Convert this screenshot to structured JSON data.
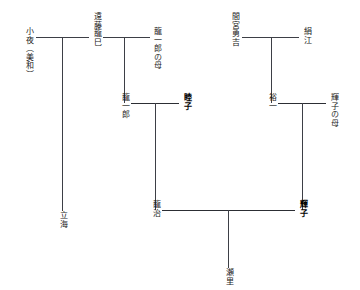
{
  "diagram": {
    "type": "genealogy-chart",
    "orientation": "vertical-japanese-text",
    "line_color": "#3d3f46",
    "background": "#ffffff",
    "persons": [
      {
        "id": "sayo",
        "label": "小夜（美和）",
        "generation": 1,
        "emphasis": false
      },
      {
        "id": "endo-tatsumi",
        "label": "遠藤龍巳",
        "generation": 1,
        "emphasis": false
      },
      {
        "id": "ryuichiro-haha",
        "label": "龍一郎の母",
        "generation": 1,
        "emphasis": false
      },
      {
        "id": "mamiya-yukichi",
        "label": "間宮勇吉",
        "generation": 1,
        "emphasis": false
      },
      {
        "id": "kinue",
        "label": "絹江",
        "generation": 1,
        "emphasis": false
      },
      {
        "id": "ryuichiro",
        "label": "龍一郎",
        "generation": 2,
        "emphasis": false
      },
      {
        "id": "mutsuko",
        "label": "睦子",
        "generation": 2,
        "emphasis": true
      },
      {
        "id": "yuichi",
        "label": "裕一",
        "generation": 2,
        "emphasis": false
      },
      {
        "id": "teruko-haha",
        "label": "輝子の母",
        "generation": 2,
        "emphasis": false
      },
      {
        "id": "tatsumi-umi",
        "label": "立海",
        "generation": 2,
        "emphasis": false
      },
      {
        "id": "ryuji",
        "label": "龍治",
        "generation": 3,
        "emphasis": false
      },
      {
        "id": "teruko",
        "label": "輝子",
        "generation": 3,
        "emphasis": true
      },
      {
        "id": "seri",
        "label": "瀬里",
        "generation": 4,
        "emphasis": false
      }
    ],
    "unions": [
      {
        "id": "union-sayo-tatsumi",
        "partners": [
          "小夜（美和）",
          "遠藤龍巳"
        ],
        "children": [
          "立海"
        ]
      },
      {
        "id": "union-tatsumi-haha",
        "partners": [
          "遠藤龍巳",
          "龍一郎の母"
        ],
        "children": [
          "龍一郎"
        ]
      },
      {
        "id": "union-yukichi-kinue",
        "partners": [
          "間宮勇吉",
          "絹江"
        ],
        "children": [
          "裕一"
        ]
      },
      {
        "id": "union-ryuichiro-mutsuko",
        "partners": [
          "龍一郎",
          "睦子"
        ],
        "children": [
          "龍治"
        ]
      },
      {
        "id": "union-yuichi-terukohaha",
        "partners": [
          "裕一",
          "輝子の母"
        ],
        "children": [
          "輝子"
        ]
      },
      {
        "id": "union-ryuji-teruko",
        "partners": [
          "龍治",
          "輝子"
        ],
        "children": [
          "瀬里"
        ]
      }
    ]
  }
}
